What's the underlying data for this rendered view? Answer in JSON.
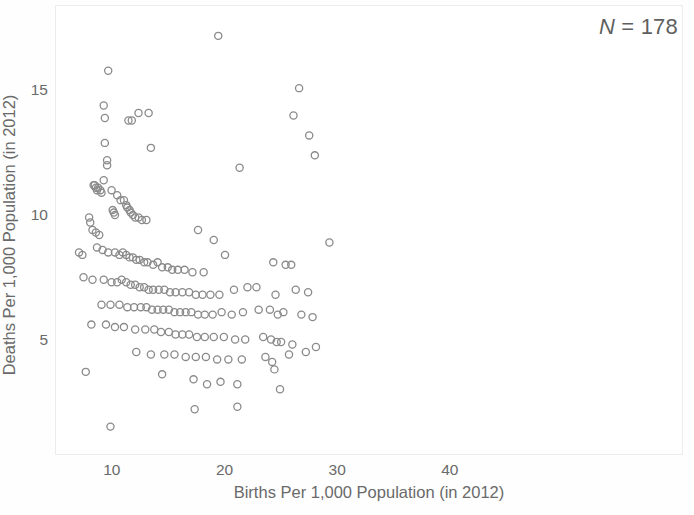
{
  "chart_data": {
    "type": "scatter",
    "title": "",
    "xlabel": "Births Per 1,000 Population (in 2012)",
    "ylabel": "Deaths Per 1,000 Population (in 2012)",
    "xlim": [
      4.95,
      60.7
    ],
    "ylim": [
      0.4,
      18.4
    ],
    "xticks": [
      10,
      20,
      30,
      40
    ],
    "xticklabels": [
      "10",
      "20",
      "30",
      "40"
    ],
    "yticks": [
      5,
      10,
      15
    ],
    "yticklabels": [
      "5",
      "10",
      "15"
    ],
    "grid": false,
    "legend": null,
    "annotations": [
      {
        "text": "N = 178",
        "position": "top-right",
        "italic_prefix": "N",
        "rest": " = 178"
      }
    ],
    "marker": {
      "shape": "open-circle",
      "diameter_px": 7.2,
      "stroke": "#8a8a8a",
      "stroke_width": 1.3,
      "fill": "none"
    },
    "n_points": 178,
    "series": [
      {
        "name": "countries",
        "points": [
          [
            19.4,
            17.2
          ],
          [
            9.6,
            15.8
          ],
          [
            26.6,
            15.1
          ],
          [
            9.2,
            14.4
          ],
          [
            12.3,
            14.1
          ],
          [
            9.3,
            13.9
          ],
          [
            11.4,
            13.8
          ],
          [
            11.7,
            13.8
          ],
          [
            13.2,
            14.1
          ],
          [
            26.1,
            14.0
          ],
          [
            9.3,
            12.9
          ],
          [
            13.4,
            12.7
          ],
          [
            27.5,
            13.2
          ],
          [
            9.5,
            12.2
          ],
          [
            9.5,
            12.0
          ],
          [
            21.3,
            11.9
          ],
          [
            9.2,
            11.4
          ],
          [
            28.0,
            12.4
          ],
          [
            8.3,
            11.2
          ],
          [
            8.4,
            11.2
          ],
          [
            8.5,
            11.1
          ],
          [
            8.6,
            11.0
          ],
          [
            8.7,
            11.1
          ],
          [
            8.9,
            11.0
          ],
          [
            9.0,
            10.9
          ],
          [
            9.9,
            11.0
          ],
          [
            10.4,
            10.8
          ],
          [
            10.7,
            10.6
          ],
          [
            11.0,
            10.6
          ],
          [
            11.2,
            10.4
          ],
          [
            11.3,
            10.3
          ],
          [
            11.5,
            10.2
          ],
          [
            11.6,
            10.1
          ],
          [
            11.8,
            10.0
          ],
          [
            12.0,
            9.9
          ],
          [
            12.3,
            9.9
          ],
          [
            10.0,
            10.2
          ],
          [
            10.1,
            10.1
          ],
          [
            10.2,
            10.0
          ],
          [
            7.9,
            9.9
          ],
          [
            8.0,
            9.7
          ],
          [
            8.2,
            9.4
          ],
          [
            8.5,
            9.3
          ],
          [
            8.8,
            9.2
          ],
          [
            12.6,
            9.8
          ],
          [
            13.0,
            9.8
          ],
          [
            17.6,
            9.4
          ],
          [
            19.0,
            9.0
          ],
          [
            29.3,
            8.9
          ],
          [
            7.0,
            8.5
          ],
          [
            7.3,
            8.4
          ],
          [
            8.6,
            8.7
          ],
          [
            9.1,
            8.6
          ],
          [
            9.6,
            8.5
          ],
          [
            10.2,
            8.5
          ],
          [
            10.6,
            8.4
          ],
          [
            10.9,
            8.5
          ],
          [
            11.2,
            8.4
          ],
          [
            11.5,
            8.3
          ],
          [
            11.8,
            8.3
          ],
          [
            12.1,
            8.2
          ],
          [
            12.4,
            8.2
          ],
          [
            12.8,
            8.1
          ],
          [
            13.1,
            8.1
          ],
          [
            13.6,
            8.0
          ],
          [
            14.0,
            8.1
          ],
          [
            14.4,
            7.9
          ],
          [
            14.9,
            7.9
          ],
          [
            15.3,
            7.8
          ],
          [
            15.8,
            7.8
          ],
          [
            16.4,
            7.8
          ],
          [
            17.1,
            7.7
          ],
          [
            18.1,
            7.7
          ],
          [
            20.0,
            8.4
          ],
          [
            24.3,
            8.1
          ],
          [
            25.4,
            8.0
          ],
          [
            25.9,
            8.0
          ],
          [
            7.4,
            7.5
          ],
          [
            8.2,
            7.4
          ],
          [
            9.2,
            7.4
          ],
          [
            9.9,
            7.3
          ],
          [
            10.4,
            7.3
          ],
          [
            10.8,
            7.4
          ],
          [
            11.2,
            7.3
          ],
          [
            11.6,
            7.2
          ],
          [
            12.0,
            7.2
          ],
          [
            12.4,
            7.1
          ],
          [
            12.8,
            7.1
          ],
          [
            13.2,
            7.0
          ],
          [
            13.6,
            7.0
          ],
          [
            14.1,
            7.0
          ],
          [
            14.6,
            7.0
          ],
          [
            15.1,
            6.9
          ],
          [
            15.6,
            6.9
          ],
          [
            16.2,
            6.9
          ],
          [
            16.8,
            6.9
          ],
          [
            17.4,
            6.8
          ],
          [
            18.0,
            6.8
          ],
          [
            18.7,
            6.8
          ],
          [
            19.5,
            6.8
          ],
          [
            20.8,
            7.0
          ],
          [
            22.0,
            7.1
          ],
          [
            22.8,
            7.1
          ],
          [
            24.5,
            6.8
          ],
          [
            26.3,
            7.0
          ],
          [
            27.4,
            6.9
          ],
          [
            9.0,
            6.4
          ],
          [
            9.8,
            6.4
          ],
          [
            10.6,
            6.4
          ],
          [
            11.3,
            6.3
          ],
          [
            11.9,
            6.3
          ],
          [
            12.5,
            6.3
          ],
          [
            13.0,
            6.3
          ],
          [
            13.5,
            6.2
          ],
          [
            14.0,
            6.2
          ],
          [
            14.5,
            6.2
          ],
          [
            15.0,
            6.2
          ],
          [
            15.5,
            6.1
          ],
          [
            16.0,
            6.1
          ],
          [
            16.5,
            6.1
          ],
          [
            17.0,
            6.1
          ],
          [
            17.6,
            6.0
          ],
          [
            18.2,
            6.0
          ],
          [
            18.9,
            6.0
          ],
          [
            19.7,
            6.1
          ],
          [
            20.6,
            6.0
          ],
          [
            21.6,
            6.1
          ],
          [
            23.0,
            6.2
          ],
          [
            24.0,
            6.2
          ],
          [
            24.7,
            6.0
          ],
          [
            25.2,
            6.1
          ],
          [
            26.8,
            6.0
          ],
          [
            27.8,
            5.9
          ],
          [
            8.1,
            5.6
          ],
          [
            9.4,
            5.6
          ],
          [
            10.2,
            5.5
          ],
          [
            11.0,
            5.5
          ],
          [
            12.0,
            5.4
          ],
          [
            12.9,
            5.4
          ],
          [
            13.7,
            5.4
          ],
          [
            14.3,
            5.3
          ],
          [
            15.0,
            5.3
          ],
          [
            15.6,
            5.2
          ],
          [
            16.2,
            5.2
          ],
          [
            16.8,
            5.2
          ],
          [
            17.5,
            5.1
          ],
          [
            18.2,
            5.1
          ],
          [
            19.0,
            5.1
          ],
          [
            19.9,
            5.1
          ],
          [
            20.9,
            5.0
          ],
          [
            21.8,
            5.0
          ],
          [
            23.4,
            5.1
          ],
          [
            24.1,
            5.0
          ],
          [
            24.6,
            4.9
          ],
          [
            25.0,
            4.9
          ],
          [
            26.0,
            4.8
          ],
          [
            28.1,
            4.7
          ],
          [
            12.1,
            4.5
          ],
          [
            13.4,
            4.4
          ],
          [
            14.6,
            4.4
          ],
          [
            15.5,
            4.4
          ],
          [
            16.5,
            4.3
          ],
          [
            17.4,
            4.3
          ],
          [
            18.3,
            4.3
          ],
          [
            19.3,
            4.2
          ],
          [
            20.3,
            4.2
          ],
          [
            21.5,
            4.2
          ],
          [
            23.6,
            4.3
          ],
          [
            24.2,
            4.1
          ],
          [
            24.4,
            3.8
          ],
          [
            25.7,
            4.4
          ],
          [
            27.2,
            4.5
          ],
          [
            7.6,
            3.7
          ],
          [
            14.4,
            3.6
          ],
          [
            17.2,
            3.4
          ],
          [
            18.4,
            3.2
          ],
          [
            19.6,
            3.3
          ],
          [
            21.1,
            3.2
          ],
          [
            24.9,
            3.0
          ],
          [
            17.3,
            2.2
          ],
          [
            21.1,
            2.3
          ],
          [
            9.8,
            1.5
          ]
        ]
      }
    ]
  },
  "axes": {
    "xtick_labels": [
      "10",
      "20",
      "30",
      "40"
    ],
    "ytick_labels": [
      "5",
      "10",
      "15"
    ],
    "x_title": "Births Per 1,000 Population (in 2012)",
    "y_title": "Deaths Per 1,000 Population (in 2012)"
  },
  "annotation": {
    "n_prefix": "N",
    "n_rest": " = 178",
    "full": "N = 178"
  },
  "colors": {
    "marker_stroke": "#8a8a8a",
    "frame": "#ececed",
    "text": "#6a6a6a",
    "background": "#ffffff"
  }
}
